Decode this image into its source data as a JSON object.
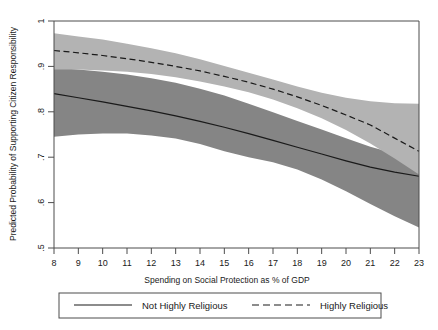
{
  "figure": {
    "background_color": "#ffffff",
    "frame_color": "#4d4d4d"
  },
  "chart_data": {
    "type": "line",
    "title": "",
    "xlabel": "Spending on Social Protection as % of GDP",
    "ylabel": "Predicted Probability of Supporting Citizen Responsibility",
    "xlim": [
      8,
      23
    ],
    "ylim": [
      0.5,
      1.0
    ],
    "xticks": [
      8,
      9,
      10,
      11,
      12,
      13,
      14,
      15,
      16,
      17,
      18,
      19,
      20,
      21,
      22,
      23
    ],
    "xtick_labels": [
      "8",
      "9",
      "10",
      "11",
      "12",
      "13",
      "14",
      "15",
      "16",
      "17",
      "18",
      "19",
      "20",
      "21",
      "22",
      "23"
    ],
    "yticks": [
      0.5,
      0.6,
      0.7,
      0.8,
      0.9,
      1.0
    ],
    "ytick_labels": [
      ".5",
      ".6",
      ".7",
      ".8",
      ".9",
      "1"
    ],
    "grid": false,
    "legend_position": "below-plot",
    "x": [
      8,
      9,
      10,
      11,
      12,
      13,
      14,
      15,
      16,
      17,
      18,
      19,
      20,
      21,
      22,
      23
    ],
    "series": [
      {
        "name": "Not Highly Religious",
        "style": "solid",
        "line_color": "#1a1a1a",
        "band_color": "#858585",
        "values": [
          0.84,
          0.831,
          0.822,
          0.812,
          0.802,
          0.791,
          0.779,
          0.766,
          0.752,
          0.737,
          0.722,
          0.707,
          0.692,
          0.678,
          0.667,
          0.658
        ],
        "ci_lower": [
          0.745,
          0.75,
          0.752,
          0.752,
          0.748,
          0.741,
          0.729,
          0.713,
          0.7,
          0.689,
          0.673,
          0.651,
          0.625,
          0.597,
          0.57,
          0.545
        ],
        "ci_upper": [
          0.897,
          0.893,
          0.888,
          0.882,
          0.874,
          0.864,
          0.851,
          0.836,
          0.818,
          0.799,
          0.78,
          0.761,
          0.742,
          0.723,
          0.708,
          0.698
        ]
      },
      {
        "name": "Highly Religious",
        "style": "dashed",
        "line_color": "#1a1a1a",
        "band_color": "#b3b3b3",
        "values": [
          0.935,
          0.93,
          0.924,
          0.917,
          0.909,
          0.9,
          0.89,
          0.878,
          0.865,
          0.85,
          0.833,
          0.814,
          0.793,
          0.771,
          0.742,
          0.713
        ],
        "ci_lower": [
          0.893,
          0.893,
          0.891,
          0.888,
          0.883,
          0.876,
          0.867,
          0.856,
          0.843,
          0.827,
          0.808,
          0.786,
          0.76,
          0.73,
          0.697,
          0.662
        ],
        "ci_upper": [
          0.973,
          0.966,
          0.959,
          0.95,
          0.94,
          0.929,
          0.916,
          0.901,
          0.886,
          0.871,
          0.856,
          0.842,
          0.831,
          0.823,
          0.819,
          0.818
        ]
      }
    ]
  },
  "legend": {
    "entries": [
      {
        "label": "Not Highly Religious",
        "style": "solid"
      },
      {
        "label": "Highly Religious",
        "style": "dashed"
      }
    ]
  }
}
